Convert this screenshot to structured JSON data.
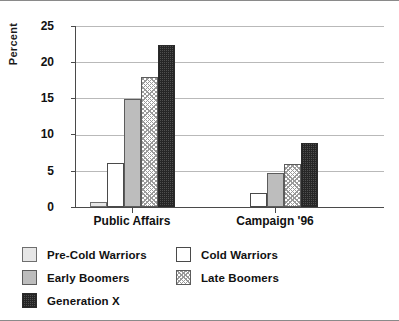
{
  "chart_data": {
    "type": "bar",
    "title": "",
    "xlabel": "",
    "ylabel": "Percent",
    "ylim": [
      0,
      25
    ],
    "yticks": [
      0,
      5,
      10,
      15,
      20,
      25
    ],
    "grid": true,
    "legend_position": "bottom-left",
    "categories": [
      "Public Affairs",
      "Campaign '96"
    ],
    "series": [
      {
        "name": "Pre-Cold Warriors",
        "values": [
          0.7,
          0
        ],
        "swatch": "light-gray-solid",
        "color": "#e6e6e6"
      },
      {
        "name": "Cold Warriors",
        "values": [
          6.1,
          2.0
        ],
        "swatch": "white-outline",
        "color": "#ffffff"
      },
      {
        "name": "Early Boomers",
        "values": [
          14.9,
          4.7
        ],
        "swatch": "medium-gray-solid",
        "color": "#bdbdbd"
      },
      {
        "name": "Late Boomers",
        "values": [
          17.9,
          6.0
        ],
        "swatch": "light-crosshatch",
        "color": "#d9d9d9"
      },
      {
        "name": "Generation X",
        "values": [
          22.4,
          8.9
        ],
        "swatch": "dark-dotted",
        "color": "#4f4f4f"
      }
    ]
  },
  "axis": {
    "y_label": "Percent",
    "y_ticks": [
      "25",
      "20",
      "15",
      "10",
      "5",
      "0"
    ],
    "x_labels": [
      "Public Affairs",
      "Campaign '96"
    ]
  },
  "legend": {
    "entries": [
      {
        "label": "Pre-Cold Warriors",
        "fill_class": "f-pre"
      },
      {
        "label": "Cold Warriors",
        "fill_class": "f-cold"
      },
      {
        "label": "Early Boomers",
        "fill_class": "f-early"
      },
      {
        "label": "Late Boomers",
        "fill_class": "f-late"
      },
      {
        "label": "Generation X",
        "fill_class": "f-genx"
      }
    ]
  }
}
